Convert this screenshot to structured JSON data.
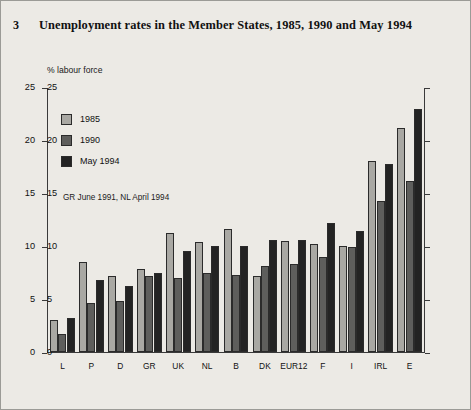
{
  "figure": {
    "number": "3",
    "title": "Unemployment rates in the Member States, 1985, 1990 and May 1994",
    "unit_label": "% labour force",
    "note": "GR June 1991, NL April 1994",
    "background_color": "#eceae5",
    "border_color": "#9b9b96"
  },
  "legend": {
    "position": "inside-top-left",
    "entries": [
      {
        "label": "1985",
        "color": "#a9a8a3"
      },
      {
        "label": "1990",
        "color": "#5e5e5c"
      },
      {
        "label": "May 1994",
        "color": "#232323"
      }
    ]
  },
  "chart_data": {
    "type": "bar",
    "title": "Unemployment rates in the Member States, 1985, 1990 and May 1994",
    "subtitle": "",
    "xlabel": "",
    "ylabel": "% labour force",
    "ylim": [
      0,
      25
    ],
    "yticks": [
      0,
      5,
      10,
      15,
      20,
      25
    ],
    "ytick_labels": [
      "0",
      "5",
      "10",
      "15",
      "20",
      "25"
    ],
    "grid": false,
    "dual_axis": true,
    "annotations": [
      "GR June 1991, NL April 1994"
    ],
    "categories": [
      "L",
      "P",
      "D",
      "GR",
      "UK",
      "NL",
      "B",
      "DK",
      "EUR12",
      "F",
      "I",
      "IRL",
      "E"
    ],
    "series": [
      {
        "name": "1985",
        "color": "#a9a8a3",
        "values": [
          3.0,
          8.5,
          7.2,
          7.8,
          11.2,
          10.4,
          11.6,
          7.2,
          10.5,
          10.2,
          10.0,
          18.0,
          21.1
        ]
      },
      {
        "name": "1990",
        "color": "#5e5e5c",
        "values": [
          1.7,
          4.6,
          4.8,
          7.2,
          7.0,
          7.5,
          7.3,
          8.1,
          8.3,
          9.0,
          9.9,
          14.2,
          16.1
        ]
      },
      {
        "name": "May 1994",
        "color": "#232323",
        "values": [
          3.2,
          6.8,
          6.2,
          7.5,
          9.5,
          10.0,
          10.0,
          10.6,
          10.6,
          12.2,
          11.4,
          17.7,
          22.9
        ]
      }
    ]
  }
}
